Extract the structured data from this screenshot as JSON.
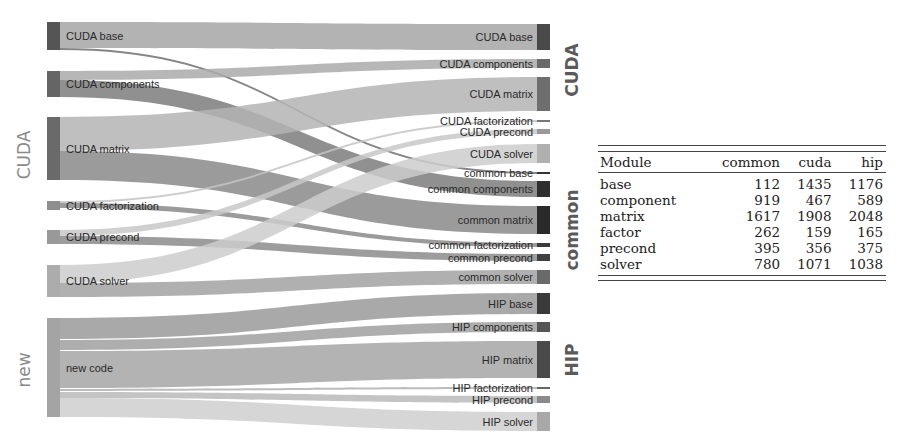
{
  "groups": {
    "left": [
      {
        "label": "CUDA",
        "y_center": 155
      },
      {
        "label": "new",
        "y_center": 370
      }
    ],
    "right": [
      {
        "label": "CUDA",
        "y_center": 70
      },
      {
        "label": "common",
        "y_center": 230
      },
      {
        "label": "HIP",
        "y_center": 360
      }
    ]
  },
  "colors": {
    "cuda_base": "#5a5a5a",
    "cuda_components": "#6a6a6a",
    "cuda_matrix": "#6e6e6e",
    "cuda_factorization": "#9a9a9a",
    "cuda_precond": "#9e9e9e",
    "cuda_solver": "#b2b2b2",
    "new_code": "#a8a8a8",
    "common_dark": "#3a3a3a",
    "hip_dark": "#4a4a4a",
    "flow": "#a0a0a0"
  },
  "left_nodes": [
    {
      "id": "cb",
      "label": "CUDA base",
      "y0": 22,
      "y1": 50,
      "color": "#555555"
    },
    {
      "id": "cc",
      "label": "CUDA components",
      "y0": 71,
      "y1": 97,
      "color": "#656565"
    },
    {
      "id": "cm",
      "label": "CUDA matrix",
      "y0": 117,
      "y1": 180,
      "color": "#6a6a6a"
    },
    {
      "id": "cf",
      "label": "CUDA factorization",
      "y0": 201,
      "y1": 210,
      "color": "#8e8e8e"
    },
    {
      "id": "cp",
      "label": "CUDA precond",
      "y0": 230,
      "y1": 244,
      "color": "#999999"
    },
    {
      "id": "cs",
      "label": "CUDA solver",
      "y0": 265,
      "y1": 297,
      "color": "#acacac"
    },
    {
      "id": "nc",
      "label": "new code",
      "y0": 318,
      "y1": 417,
      "color": "#a4a4a4"
    }
  ],
  "right_nodes": [
    {
      "id": "rcb",
      "label": "CUDA base",
      "y0": 24,
      "y1": 50,
      "color": "#4a4a4a"
    },
    {
      "id": "rcc",
      "label": "CUDA components",
      "y0": 59,
      "y1": 68,
      "color": "#6a6a6a"
    },
    {
      "id": "rcm",
      "label": "CUDA matrix",
      "y0": 77,
      "y1": 111,
      "color": "#6e6e6e"
    },
    {
      "id": "rcf",
      "label": "CUDA factorization",
      "y0": 120,
      "y1": 122,
      "color": "#777777"
    },
    {
      "id": "rcp",
      "label": "CUDA precond",
      "y0": 129,
      "y1": 134,
      "color": "#999999"
    },
    {
      "id": "rcs",
      "label": "CUDA solver",
      "y0": 144,
      "y1": 163,
      "color": "#b0b0b0"
    },
    {
      "id": "rmb",
      "label": "common base",
      "y0": 172,
      "y1": 174,
      "color": "#333333"
    },
    {
      "id": "rmc",
      "label": "common components",
      "y0": 181,
      "y1": 197,
      "color": "#2e2e2e"
    },
    {
      "id": "rmm",
      "label": "common matrix",
      "y0": 206,
      "y1": 234,
      "color": "#2a2a2a"
    },
    {
      "id": "rmf",
      "label": "common factorization",
      "y0": 243,
      "y1": 247,
      "color": "#3a3a3a"
    },
    {
      "id": "rmp",
      "label": "common precond",
      "y0": 254,
      "y1": 261,
      "color": "#404040"
    },
    {
      "id": "rms",
      "label": "common solver",
      "y0": 270,
      "y1": 284,
      "color": "#6a6a6a"
    },
    {
      "id": "rhb",
      "label": "HIP base",
      "y0": 293,
      "y1": 314,
      "color": "#3a3a3a"
    },
    {
      "id": "rhc",
      "label": "HIP components",
      "y0": 322,
      "y1": 332,
      "color": "#555555"
    },
    {
      "id": "rhm",
      "label": "HIP matrix",
      "y0": 341,
      "y1": 378,
      "color": "#4a4a4a"
    },
    {
      "id": "rhf",
      "label": "HIP factorization",
      "y0": 387,
      "y1": 389,
      "color": "#666666"
    },
    {
      "id": "rhp",
      "label": "HIP precond",
      "y0": 396,
      "y1": 403,
      "color": "#8a8a8a"
    },
    {
      "id": "rhs",
      "label": "HIP solver",
      "y0": 412,
      "y1": 431,
      "color": "#a8a8a8"
    }
  ],
  "flows": [
    {
      "from": "cb",
      "ly0": 22,
      "ly1": 48,
      "to": "rcb",
      "ry0": 24,
      "ry1": 50,
      "color": "#a6a6a6"
    },
    {
      "from": "cb",
      "ly0": 48,
      "ly1": 50,
      "to": "rmb",
      "ry0": 172,
      "ry1": 174,
      "color": "#707070"
    },
    {
      "from": "cc",
      "ly0": 71,
      "ly1": 80,
      "to": "rcc",
      "ry0": 59,
      "ry1": 68,
      "color": "#aaaaaa"
    },
    {
      "from": "cc",
      "ly0": 80,
      "ly1": 97,
      "to": "rmc",
      "ry0": 181,
      "ry1": 197,
      "color": "#7c7c7c"
    },
    {
      "from": "cm",
      "ly0": 117,
      "ly1": 151,
      "to": "rcm",
      "ry0": 77,
      "ry1": 111,
      "color": "#b4b4b4"
    },
    {
      "from": "cm",
      "ly0": 151,
      "ly1": 180,
      "to": "rmm",
      "ry0": 206,
      "ry1": 234,
      "color": "#8a8a8a"
    },
    {
      "from": "cf",
      "ly0": 201,
      "ly1": 203,
      "to": "rcf",
      "ry0": 120,
      "ry1": 122,
      "color": "#c4c4c4"
    },
    {
      "from": "cf",
      "ly0": 203,
      "ly1": 208,
      "to": "rmf",
      "ry0": 243,
      "ry1": 247,
      "color": "#8a8a8a"
    },
    {
      "from": "cp",
      "ly0": 230,
      "ly1": 236,
      "to": "rcp",
      "ry0": 129,
      "ry1": 134,
      "color": "#c8c8c8"
    },
    {
      "from": "cp",
      "ly0": 236,
      "ly1": 244,
      "to": "rmp",
      "ry0": 254,
      "ry1": 261,
      "color": "#8c8c8c"
    },
    {
      "from": "cs",
      "ly0": 265,
      "ly1": 283,
      "to": "rcs",
      "ry0": 144,
      "ry1": 163,
      "color": "#cdcdcd"
    },
    {
      "from": "cs",
      "ly0": 283,
      "ly1": 297,
      "to": "rms",
      "ry0": 270,
      "ry1": 284,
      "color": "#a2a2a2"
    },
    {
      "from": "nc",
      "ly0": 318,
      "ly1": 339,
      "to": "rhb",
      "ry0": 293,
      "ry1": 314,
      "color": "#9a9a9a"
    },
    {
      "from": "nc",
      "ly0": 340,
      "ly1": 350,
      "to": "rhc",
      "ry0": 322,
      "ry1": 332,
      "color": "#a0a0a0"
    },
    {
      "from": "nc",
      "ly0": 351,
      "ly1": 388,
      "to": "rhm",
      "ry0": 341,
      "ry1": 378,
      "color": "#a6a6a6"
    },
    {
      "from": "nc",
      "ly0": 389,
      "ly1": 391,
      "to": "rhf",
      "ry0": 387,
      "ry1": 389,
      "color": "#b0b0b0"
    },
    {
      "from": "nc",
      "ly0": 392,
      "ly1": 398,
      "to": "rhp",
      "ry0": 396,
      "ry1": 403,
      "color": "#bababa"
    },
    {
      "from": "nc",
      "ly0": 398,
      "ly1": 417,
      "to": "rhs",
      "ry0": 412,
      "ry1": 431,
      "color": "#cfcfcf"
    }
  ],
  "layout": {
    "left_x": 47,
    "node_w": 13,
    "right_x": 537
  },
  "table": {
    "headers": [
      "Module",
      "common",
      "cuda",
      "hip"
    ],
    "rows": [
      [
        "base",
        "112",
        "1435",
        "1176"
      ],
      [
        "component",
        "919",
        "467",
        "589"
      ],
      [
        "matrix",
        "1617",
        "1908",
        "2048"
      ],
      [
        "factor",
        "262",
        "159",
        "165"
      ],
      [
        "precond",
        "395",
        "356",
        "375"
      ],
      [
        "solver",
        "780",
        "1071",
        "1038"
      ]
    ]
  },
  "chart_data": {
    "type": "table",
    "title": "",
    "columns": [
      "Module",
      "common",
      "cuda",
      "hip"
    ],
    "rows": [
      {
        "Module": "base",
        "common": 112,
        "cuda": 1435,
        "hip": 1176
      },
      {
        "Module": "component",
        "common": 919,
        "cuda": 467,
        "hip": 589
      },
      {
        "Module": "matrix",
        "common": 1617,
        "cuda": 1908,
        "hip": 2048
      },
      {
        "Module": "factor",
        "common": 262,
        "cuda": 159,
        "hip": 165
      },
      {
        "Module": "precond",
        "common": 395,
        "cuda": 356,
        "hip": 375
      },
      {
        "Module": "solver",
        "common": 780,
        "cuda": 1071,
        "hip": 1038
      }
    ],
    "sankey": {
      "sources": [
        "CUDA base",
        "CUDA components",
        "CUDA matrix",
        "CUDA factorization",
        "CUDA precond",
        "CUDA solver",
        "new code"
      ],
      "targets": [
        "CUDA base",
        "CUDA components",
        "CUDA matrix",
        "CUDA factorization",
        "CUDA precond",
        "CUDA solver",
        "common base",
        "common components",
        "common matrix",
        "common factorization",
        "common precond",
        "common solver",
        "HIP base",
        "HIP components",
        "HIP matrix",
        "HIP factorization",
        "HIP precond",
        "HIP solver"
      ],
      "source_groups": [
        "CUDA",
        "new"
      ],
      "target_groups": [
        "CUDA",
        "common",
        "HIP"
      ]
    }
  }
}
